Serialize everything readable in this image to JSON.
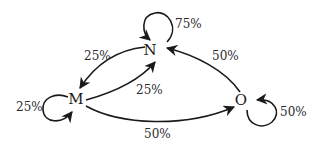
{
  "diagram": {
    "type": "state-transition",
    "nodes": [
      {
        "id": "N",
        "label": "N"
      },
      {
        "id": "M",
        "label": "M"
      },
      {
        "id": "O",
        "label": "O"
      }
    ],
    "edges": [
      {
        "from": "N",
        "to": "N",
        "label": "75%"
      },
      {
        "from": "N",
        "to": "M",
        "label": "25%"
      },
      {
        "from": "M",
        "to": "N",
        "label": "25%"
      },
      {
        "from": "M",
        "to": "M",
        "label": "25%"
      },
      {
        "from": "M",
        "to": "O",
        "label": "50%"
      },
      {
        "from": "O",
        "to": "N",
        "label": "50%"
      },
      {
        "from": "O",
        "to": "O",
        "label": "50%"
      }
    ]
  }
}
